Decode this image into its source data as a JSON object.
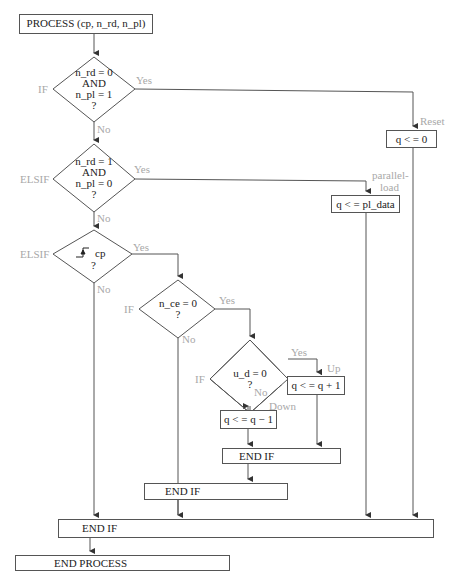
{
  "diagram": {
    "type": "flowchart",
    "start": {
      "label": "PROCESS (cp, n_rd, n_pl)"
    },
    "decisions": [
      {
        "id": "d1",
        "keyword": "IF",
        "lines": [
          "n_rd = 0",
          "AND",
          "n_pl = 1",
          "?"
        ],
        "yes": "Yes",
        "no": "No"
      },
      {
        "id": "d2",
        "keyword": "ELSIF",
        "lines": [
          "n_rd = 1",
          "AND",
          "n_pl = 0",
          "?"
        ],
        "yes": "Yes",
        "no": "No"
      },
      {
        "id": "d3",
        "keyword": "ELSIF",
        "lines": [
          "cp",
          "?"
        ],
        "edge_symbol": "rising-edge",
        "yes": "Yes",
        "no": "No"
      },
      {
        "id": "d4",
        "keyword": "IF",
        "lines": [
          "n_ce = 0",
          "?"
        ],
        "yes": "Yes",
        "no": "No"
      },
      {
        "id": "d5",
        "keyword": "IF",
        "lines": [
          "u_d = 0",
          "?"
        ],
        "yes": "Yes",
        "no": "No"
      }
    ],
    "actions": [
      {
        "id": "a_reset",
        "annotation": "Reset",
        "label": "q < = 0"
      },
      {
        "id": "a_load",
        "annotation_lines": [
          "parallel-",
          "load"
        ],
        "label": "q < = pl_data"
      },
      {
        "id": "a_up",
        "annotation": "Up",
        "label": "q < = q + 1"
      },
      {
        "id": "a_down",
        "annotation": "Down",
        "label": "q < = q − 1"
      }
    ],
    "ends": [
      {
        "id": "e_inner",
        "label": "END IF"
      },
      {
        "id": "e_mid",
        "label": "END IF"
      },
      {
        "id": "e_outer",
        "label": "END IF"
      },
      {
        "id": "e_process",
        "label": "END PROCESS"
      }
    ]
  },
  "colors": {
    "line": "#555555",
    "text": "#222222",
    "annotation": "#a8a8a8"
  }
}
